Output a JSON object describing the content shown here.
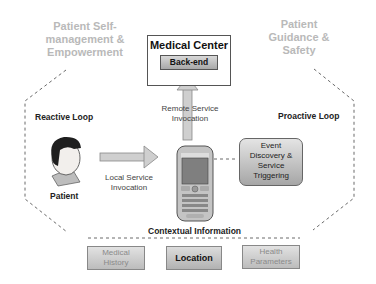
{
  "top_left_title": [
    "Patient Self-",
    "management &",
    "Empowerment"
  ],
  "top_right_title": [
    "Patient",
    "Guidance &",
    "Safety"
  ],
  "medical_center": {
    "title": "Medical Center",
    "backend_label": "Back-end"
  },
  "remote_invocation": [
    "Remote Service",
    "Invocation"
  ],
  "local_invocation": [
    "Local Service",
    "Invocation"
  ],
  "reactive_loop_label": "Reactive Loop",
  "proactive_loop_label": "Proactive Loop",
  "patient_label": "Patient",
  "event_box": [
    "Event",
    "Discovery &",
    "Service",
    "Triggering"
  ],
  "contextual_information": {
    "title": "Contextual Information",
    "items": [
      {
        "label": [
          "Medical",
          "History"
        ],
        "emphasis": false
      },
      {
        "label": [
          "Location"
        ],
        "emphasis": true
      },
      {
        "label": [
          "Health",
          "Parameters"
        ],
        "emphasis": false
      }
    ]
  },
  "phone_brand": "EPIC",
  "colors": {
    "light_text": "#b9b9b9",
    "dashed_line": "#666666",
    "box_gray": "#bdbdbd"
  }
}
